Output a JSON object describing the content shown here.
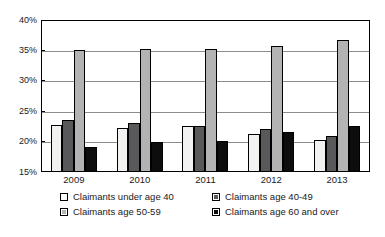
{
  "chart_data": {
    "type": "bar",
    "title": "",
    "xlabel": "",
    "ylabel": "",
    "categories": [
      "2009",
      "2010",
      "2011",
      "2012",
      "2013"
    ],
    "ylim": [
      15,
      40
    ],
    "ytick_labels": [
      "15%",
      "20%",
      "25%",
      "30%",
      "35%",
      "40%"
    ],
    "ytick_values": [
      15,
      20,
      25,
      30,
      35,
      40
    ],
    "grid": true,
    "legend_position": "below",
    "series": [
      {
        "name": "Claimants under age 40",
        "color": "#f2f2f0",
        "values": [
          22.8,
          22.3,
          22.6,
          21.2,
          20.2
        ]
      },
      {
        "name": "Claimants age 40-49",
        "color": "#59595b",
        "values": [
          23.5,
          23.0,
          22.5,
          22.0,
          20.9
        ]
      },
      {
        "name": "Claimants age 50-59",
        "color": "#b3b3b3",
        "values": [
          35.0,
          35.3,
          35.3,
          35.8,
          36.7
        ]
      },
      {
        "name": "Claimants age 60 and over",
        "color": "#0d0d0d",
        "values": [
          19.1,
          19.9,
          20.1,
          21.5,
          22.6
        ]
      }
    ]
  },
  "title_sliver": "",
  "legend": {
    "items": [
      {
        "label": "Claimants under age 40",
        "swatch": "white-square-icon"
      },
      {
        "label": "Claimants age 40-49",
        "swatch": "dark-gray-square-icon"
      },
      {
        "label": "Claimants age 50-59",
        "swatch": "light-gray-square-icon"
      },
      {
        "label": "Claimants age 60 and over",
        "swatch": "black-square-icon"
      }
    ]
  }
}
